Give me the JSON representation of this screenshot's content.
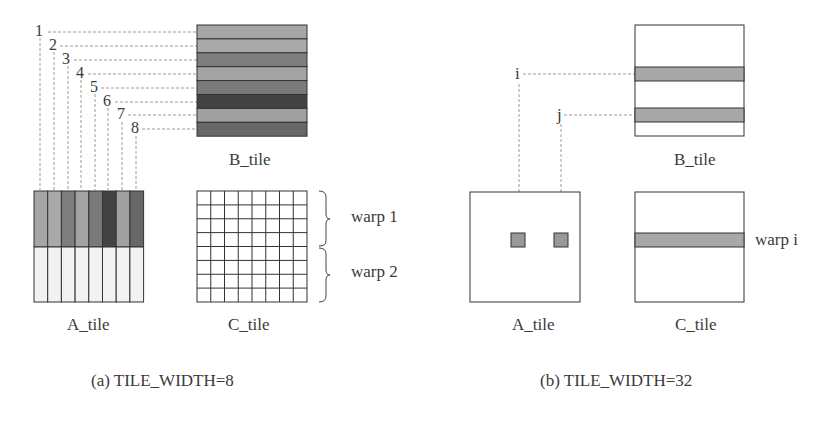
{
  "panel_a": {
    "caption": "(a) TILE_WIDTH=8",
    "b_tile_label": "B_tile",
    "a_tile_label": "A_tile",
    "c_tile_label": "C_tile",
    "row_numbers": [
      "1",
      "2",
      "3",
      "4",
      "5",
      "6",
      "7",
      "8"
    ],
    "warp_labels": [
      "warp 1",
      "warp 2"
    ],
    "stripe_colors": [
      "#a6a6a6",
      "#a9a9a9",
      "#7e7e7e",
      "#a3a3a3",
      "#7a7a7a",
      "#434343",
      "#a0a0a0",
      "#676767"
    ],
    "lower_fill": "#f2f2f2"
  },
  "panel_b": {
    "caption": "(b) TILE_WIDTH=32",
    "b_tile_label": "B_tile",
    "a_tile_label": "A_tile",
    "c_tile_label": "C_tile",
    "index_labels": [
      "i",
      "j"
    ],
    "warp_label": "warp i",
    "highlight_color": "#a8a8a8"
  }
}
